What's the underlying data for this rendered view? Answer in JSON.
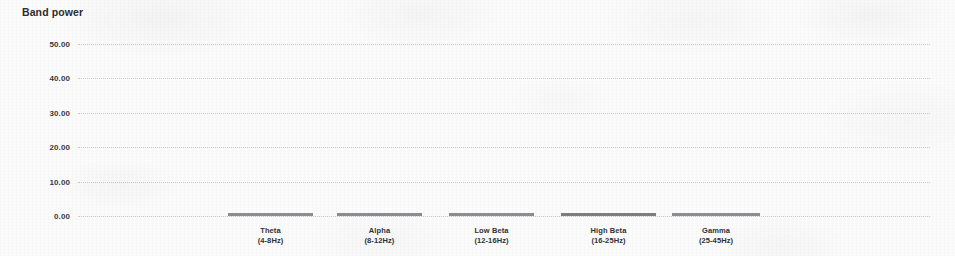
{
  "chart_data": {
    "type": "bar",
    "title": "Band power",
    "xlabel": "",
    "ylabel": "",
    "ylim": [
      0,
      50
    ],
    "grid": true,
    "legend": "none",
    "categories": [
      "Theta\n(4-8Hz)",
      "Alpha\n(8-12Hz)",
      "Low Beta\n(12-16Hz)",
      "High Beta\n(16-25Hz)",
      "Gamma\n(25-45Hz)"
    ],
    "values": [
      0.45,
      0.45,
      0.45,
      0.85,
      0.4
    ],
    "ytick_labels": [
      "0.00",
      "10.00",
      "20.00",
      "30.00",
      "40.00",
      "50.00"
    ],
    "ytick_values": [
      0,
      10,
      20,
      30,
      40,
      50
    ]
  },
  "chart": {
    "title": "Band power",
    "bar_color": "#8d8d90",
    "accent_bar_color": "#7e7e82",
    "gridline_color": "#c9cace",
    "background": "#fbfbfc",
    "text_color": "#303034",
    "y_axis": {
      "ticks": [
        {
          "label": "50.00",
          "value": 50
        },
        {
          "label": "40.00",
          "value": 40
        },
        {
          "label": "30.00",
          "value": 30
        },
        {
          "label": "20.00",
          "value": 20
        },
        {
          "label": "10.00",
          "value": 10
        },
        {
          "label": "0.00",
          "value": 0
        }
      ]
    },
    "bands": [
      {
        "name": "Theta",
        "range": "(4-8Hz)",
        "value": 0.45
      },
      {
        "name": "Alpha",
        "range": "(8-12Hz)",
        "value": 0.45
      },
      {
        "name": "Low Beta",
        "range": "(12-16Hz)",
        "value": 0.45
      },
      {
        "name": "High Beta",
        "range": "(16-25Hz)",
        "value": 0.85
      },
      {
        "name": "Gamma",
        "range": "(25-45Hz)",
        "value": 0.4
      }
    ]
  }
}
